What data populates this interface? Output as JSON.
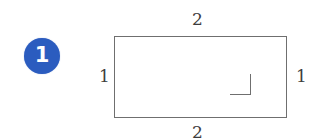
{
  "figure": {
    "kind": "rectangle-with-right-angle-marker",
    "item_number": "1",
    "badge_color": "#2b5cbf",
    "badge_text_color": "#ffffff",
    "stroke_color": "#6f6f6f",
    "background_color": "#ffffff",
    "label_color": "#3d3d3d"
  },
  "labels": {
    "top": "2",
    "bottom": "2",
    "left": "1",
    "right": "1"
  },
  "chart_data": {
    "type": "diagram",
    "title": "",
    "shape": "rectangle",
    "item_number": "1",
    "annotations": [
      {
        "name": "top-side-length",
        "position": "top",
        "value": 2,
        "text": "2"
      },
      {
        "name": "right-side-length",
        "position": "right",
        "value": 1,
        "text": "1"
      },
      {
        "name": "bottom-side-length",
        "position": "bottom",
        "value": 2,
        "text": "2"
      },
      {
        "name": "left-side-length",
        "position": "left",
        "value": 1,
        "text": "1"
      },
      {
        "name": "right-angle-marker",
        "position": "top-left-corner",
        "value": 90,
        "text": ""
      }
    ],
    "width": 2,
    "height": 1,
    "units": "",
    "grid": false,
    "legend": null
  }
}
